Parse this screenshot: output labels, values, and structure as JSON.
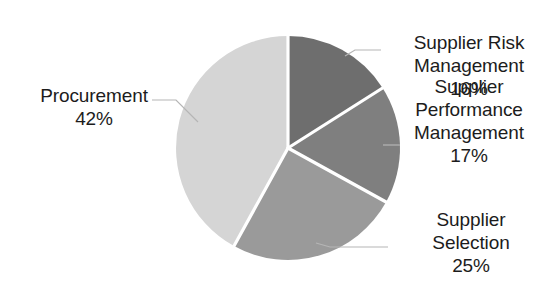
{
  "chart_data": {
    "type": "pie",
    "title": "",
    "subtitle": "",
    "xlabel": "",
    "ylabel": "",
    "legend_position": "none",
    "grid": false,
    "labels_show_percent": true,
    "categories": [
      "Supplier Risk Management",
      "Supplier Performance Management",
      "Supplier Selection",
      "Procurement"
    ],
    "values": [
      16,
      17,
      25,
      42
    ],
    "value_labels": [
      "16%",
      "17%",
      "25%",
      "42%"
    ],
    "colors": [
      "#6e6e6e",
      "#7f7f7f",
      "#9a9a9a",
      "#d5d5d5"
    ],
    "start_angle_deg": 0,
    "direction": "clockwise",
    "slices": [
      {
        "name": "Supplier Risk Management",
        "value": 16,
        "percent_label": "16%",
        "color": "#6e6e6e"
      },
      {
        "name": "Supplier Performance Management",
        "value": 17,
        "percent_label": "17%",
        "color": "#7f7f7f"
      },
      {
        "name": "Supplier Selection",
        "value": 25,
        "percent_label": "25%",
        "color": "#9a9a9a"
      },
      {
        "name": "Procurement",
        "value": 42,
        "percent_label": "42%",
        "color": "#d5d5d5"
      }
    ]
  },
  "labels": {
    "procurement": {
      "line1": "Procurement",
      "line2": "42%"
    },
    "supplier_risk": {
      "line1": "Supplier Risk",
      "line2": "Management",
      "line3": "16%"
    },
    "supplier_performance": {
      "line1": "Supplier",
      "line2": "Performance",
      "line3": "Management",
      "line4": "17%"
    },
    "supplier_selection": {
      "line1": "Supplier",
      "line2": "Selection",
      "line3": "25%"
    }
  },
  "style": {
    "background": "#ffffff",
    "slice_divider": "#ffffff",
    "leader_line": "#b0b0b0",
    "text_color": "#1c1c1c"
  }
}
